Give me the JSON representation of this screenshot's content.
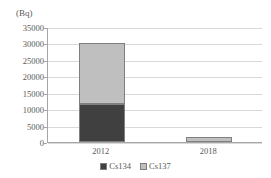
{
  "chart_data": {
    "type": "bar",
    "title": "",
    "subtitle": "",
    "xlabel": "",
    "ylabel": "",
    "unit_label": "(Bq)",
    "stacked": true,
    "categories": [
      "2012",
      "2018"
    ],
    "series": [
      {
        "name": "Cs134",
        "values": [
          11500,
          0
        ],
        "color": "#404040"
      },
      {
        "name": "Cs137",
        "values": [
          18500,
          1500
        ],
        "color": "#bfbfbf"
      }
    ],
    "ylim": [
      0,
      35000
    ],
    "ytick_step": 5000,
    "yticks": [
      0,
      5000,
      10000,
      15000,
      20000,
      25000,
      30000,
      35000
    ],
    "ytick_labels": [
      "0",
      "5000",
      "10000",
      "15000",
      "20000",
      "25000",
      "30000",
      "35000"
    ],
    "grid": true,
    "grid_axis": "y",
    "legend_position": "bottom",
    "legend_entries": [
      "Cs134",
      "Cs137"
    ],
    "totals": [
      30000,
      1500
    ],
    "axis_color": "#a6a6a6",
    "grid_color": "#d9d9d9",
    "text_color": "#595959",
    "bar_border_color": "#7f7f7f",
    "background": "#ffffff"
  }
}
